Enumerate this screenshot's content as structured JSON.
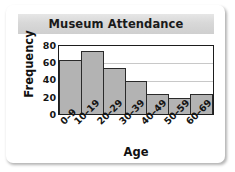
{
  "chart_data": {
    "type": "bar",
    "title": "Museum Attendance",
    "xlabel": "Age",
    "ylabel": "Frequency",
    "categories": [
      "0–9",
      "10–19",
      "20–29",
      "30–39",
      "40–49",
      "50–59",
      "60–69"
    ],
    "values": [
      63,
      74,
      54,
      39,
      24,
      19,
      24
    ],
    "ylim": [
      0,
      80
    ],
    "yticks": [
      0,
      20,
      40,
      60,
      80
    ],
    "ytick_labels": [
      "0",
      "20",
      "40",
      "60",
      "80"
    ],
    "gridlines": [
      20,
      40,
      60
    ],
    "grid": true,
    "legend": null,
    "bar_fill_color": "#b3b3b3",
    "bar_edge_color": "#2a2a2a",
    "gridline_color": "#c8c8c8",
    "frame_color": "#1d1d1d",
    "title_band_color": "#d8d8d8",
    "background_color": "#ffffff"
  }
}
